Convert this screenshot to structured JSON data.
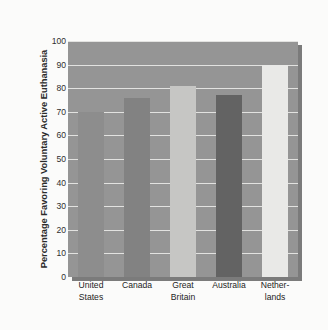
{
  "chart_data": {
    "type": "bar",
    "title": "",
    "xlabel": "",
    "ylabel": "Percentage Favoring Voluntary Active Euthanasia",
    "ylim": [
      0,
      100
    ],
    "ytick_step": 10,
    "yticks": [
      "100",
      "90",
      "80",
      "70",
      "60",
      "50",
      "40",
      "30",
      "20",
      "10",
      "0"
    ],
    "grid": true,
    "legend": "none",
    "categories": [
      "United States",
      "Canada",
      "Great Britain",
      "Australia",
      "Netherlands"
    ],
    "category_lines": [
      [
        "United",
        "States"
      ],
      [
        "Canada",
        ""
      ],
      [
        "Great",
        "Britain"
      ],
      [
        "Australia",
        ""
      ],
      [
        "Nether-",
        "lands"
      ]
    ],
    "values": [
      70,
      76,
      81,
      77,
      90
    ],
    "bar_colors": [
      "#8d8d8d",
      "#828282",
      "#c6c6c4",
      "#636363",
      "#e9e9e7"
    ],
    "plot_background": "#959595",
    "gridline_color": "#e8e8e6",
    "page_background": "#fbfbfa"
  }
}
